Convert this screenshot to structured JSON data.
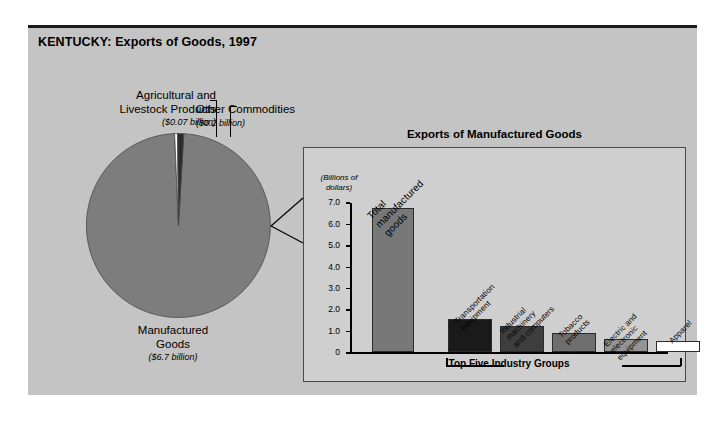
{
  "figure": {
    "title": "KENTUCKY: Exports of Goods, 1997",
    "panel_color": "#c4c4c4",
    "border_color": "#1a1a1a"
  },
  "pie": {
    "labels": [
      {
        "name": "Agricultural and\nLivestock Products",
        "amount": "($0.07 billion)"
      },
      {
        "name": "Other Commodities",
        "amount": "($0.2 billion)"
      },
      {
        "name": "Manufactured\nGoods",
        "amount": "($6.7 billion)"
      }
    ],
    "agricultural_name": "Agricultural and Livestock Products",
    "agricultural_amount": "($0.07 billion)",
    "other_name": "Other Commodities",
    "other_amount": "($0.2 billion)",
    "manufactured_name": "Manufactured Goods",
    "manufactured_amount": "($6.7 billion)"
  },
  "bar_panel": {
    "title": "Exports of Manufactured Goods",
    "units": "(Billions of\ndollars)",
    "bracket_label": "Top Five Industry Groups"
  },
  "chart_data": [
    {
      "type": "pie",
      "title": "KENTUCKY: Exports of Goods, 1997",
      "labels": [
        "Manufactured Goods",
        "Agricultural and Livestock Products",
        "Other Commodities"
      ],
      "values": [
        6.7,
        0.07,
        0.2
      ],
      "value_texts": [
        "($6.7 billion)",
        "($0.07 billion)",
        "($0.2 billion)"
      ],
      "units": "billions of dollars",
      "colors": [
        "#7d7d7d",
        "#ffffff",
        "#2b2b2b"
      ],
      "legend": "labels placed around pie with leader lines"
    },
    {
      "type": "bar",
      "title": "Exports of Manufactured Goods",
      "ylabel": "(Billions of dollars)",
      "xlabel": "",
      "ylim": [
        0,
        7.0
      ],
      "yticks": [
        "0",
        "1.0",
        "2.0",
        "3.0",
        "4.0",
        "5.0",
        "6.0",
        "7.0"
      ],
      "ytick_values": [
        0,
        1.0,
        2.0,
        3.0,
        4.0,
        5.0,
        6.0,
        7.0
      ],
      "grid": false,
      "categories": [
        "Total manufactured goods",
        "Transportation equipment",
        "Industrial machinery and computers",
        "Tobacco products",
        "Electric and electronic equipment",
        "Apparel"
      ],
      "values": [
        6.7,
        1.55,
        1.2,
        0.88,
        0.62,
        0.5
      ],
      "colors": [
        "#787878",
        "#1a1a1a",
        "#3d3d3d",
        "#6e6e6e",
        "#949494",
        "#ffffff"
      ],
      "annotation": "Top Five Industry Groups"
    }
  ],
  "bars": [
    {
      "label": "Total\nmanufactured\ngoods",
      "value": 6.7,
      "color": "#787878",
      "left": 22,
      "width": 42,
      "rotated": true,
      "big": true
    },
    {
      "label": "Transportation\nequipment",
      "value": 1.55,
      "color": "#1a1a1a",
      "left": 98,
      "width": 44,
      "rotated": true,
      "big": false
    },
    {
      "label": "Industrial\nmachinery\nand computers",
      "value": 1.2,
      "color": "#3d3d3d",
      "left": 150,
      "width": 44,
      "rotated": true,
      "big": false
    },
    {
      "label": "Tobacco\nproducts",
      "value": 0.88,
      "color": "#6e6e6e",
      "left": 202,
      "width": 44,
      "rotated": true,
      "big": false
    },
    {
      "label": "Electric and\nelectronic\nequipment",
      "value": 0.62,
      "color": "#949494",
      "left": 254,
      "width": 44,
      "rotated": true,
      "big": false
    },
    {
      "label": "Apparel",
      "value": 0.5,
      "color": "#ffffff",
      "left": 306,
      "width": 44,
      "rotated": true,
      "big": false
    }
  ],
  "yticks": [
    {
      "label": "7.0",
      "value": 7.0
    },
    {
      "label": "6.0",
      "value": 6.0
    },
    {
      "label": "5.0",
      "value": 5.0
    },
    {
      "label": "4.0",
      "value": 4.0
    },
    {
      "label": "3.0",
      "value": 3.0
    },
    {
      "label": "2.0",
      "value": 2.0
    },
    {
      "label": "1.0",
      "value": 1.0
    },
    {
      "label": "0",
      "value": 0
    }
  ]
}
